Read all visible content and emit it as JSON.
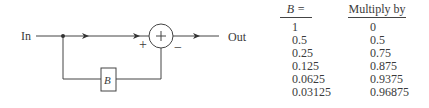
{
  "diagram": {
    "input_label": "In",
    "output_label": "Out",
    "summer_symbol": "+",
    "summer_input_signs": {
      "top": "+",
      "bottom": "−"
    },
    "feedback_block_label": "B"
  },
  "table": {
    "headers": {
      "b": "B =",
      "multiply": "Multiply by"
    },
    "rows": [
      {
        "b": "1",
        "multiply": "0"
      },
      {
        "b": "0.5",
        "multiply": "0.5"
      },
      {
        "b": "0.25",
        "multiply": "0.75"
      },
      {
        "b": "0.125",
        "multiply": "0.875"
      },
      {
        "b": "0.0625",
        "multiply": "0.9375"
      },
      {
        "b": "0.03125",
        "multiply": "0.96875"
      }
    ]
  }
}
